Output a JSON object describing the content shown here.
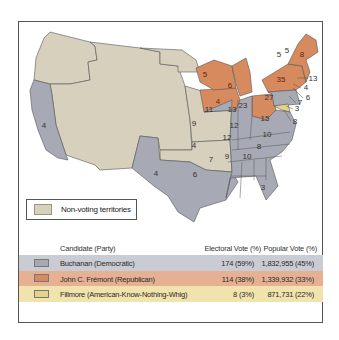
{
  "map": {
    "title": "Election of 1856",
    "colors": {
      "buchanan": "#a7aab4",
      "fremont": "#d68a5e",
      "fillmore": "#e6d38a",
      "territory": "#d6d0bd",
      "water": "#ffffff",
      "border": "#555555"
    },
    "state_labels": [
      {
        "state": "California",
        "value": "4",
        "party": "buchanan"
      },
      {
        "state": "Texas",
        "value": "4",
        "party": "buchanan"
      },
      {
        "state": "Iowa",
        "value": "4",
        "party": "fremont"
      },
      {
        "state": "Wisconsin",
        "value": "5",
        "party": "fremont"
      },
      {
        "state": "Michigan",
        "value": "6",
        "party": "fremont"
      },
      {
        "state": "Ohio",
        "value": "23",
        "party": "fremont"
      },
      {
        "state": "New York",
        "value": "35",
        "party": "fremont"
      },
      {
        "state": "Vermont",
        "value": "5",
        "party": "fremont"
      },
      {
        "state": "New Hampshire",
        "value": "5",
        "party": "fremont"
      },
      {
        "state": "Maine",
        "value": "8",
        "party": "fremont"
      },
      {
        "state": "Massachusetts",
        "value": "13",
        "party": "fremont"
      },
      {
        "state": "Rhode Island",
        "value": "4",
        "party": "fremont"
      },
      {
        "state": "Connecticut",
        "value": "6",
        "party": "fremont"
      },
      {
        "state": "New Jersey",
        "value": "7",
        "party": "buchanan"
      },
      {
        "state": "Delaware",
        "value": "3",
        "party": "buchanan"
      },
      {
        "state": "Maryland",
        "value": "8",
        "party": "fillmore"
      },
      {
        "state": "Pennsylvania",
        "value": "27",
        "party": "buchanan"
      },
      {
        "state": "Illinois",
        "value": "11",
        "party": "buchanan"
      },
      {
        "state": "Indiana",
        "value": "13",
        "party": "buchanan"
      },
      {
        "state": "Missouri",
        "value": "9",
        "party": "buchanan"
      },
      {
        "state": "Kentucky",
        "value": "12",
        "party": "buchanan"
      },
      {
        "state": "Virginia",
        "value": "15",
        "party": "buchanan"
      },
      {
        "state": "Tennessee",
        "value": "12",
        "party": "buchanan"
      },
      {
        "state": "North Carolina",
        "value": "10",
        "party": "buchanan"
      },
      {
        "state": "Arkansas",
        "value": "4",
        "party": "buchanan"
      },
      {
        "state": "South Carolina",
        "value": "8",
        "party": "buchanan"
      },
      {
        "state": "Louisiana",
        "value": "6",
        "party": "buchanan"
      },
      {
        "state": "Mississippi",
        "value": "7",
        "party": "buchanan"
      },
      {
        "state": "Alabama",
        "value": "9",
        "party": "buchanan"
      },
      {
        "state": "Georgia",
        "value": "10",
        "party": "buchanan"
      },
      {
        "state": "Florida",
        "value": "3",
        "party": "buchanan"
      }
    ]
  },
  "legend": {
    "territories_label": "Non-voting territories"
  },
  "table": {
    "headers": {
      "candidate": "Candidate (Party)",
      "electoral": "Electoral Vote (%)",
      "popular": "Popular Vote (%)"
    },
    "rows": [
      {
        "candidate": "Buchanan (Democratic)",
        "electoral": "174 (59%)",
        "popular": "1,832,955 (45%)",
        "color": "#a7aab4",
        "row_bg": "#c9ccd3"
      },
      {
        "candidate": "John C. Frémont (Republican)",
        "electoral": "114 (38%)",
        "popular": "1,339,932 (33%)",
        "color": "#d68a5e",
        "row_bg": "#e6b193"
      },
      {
        "candidate": "Fillmore (American-Know-Nothing-Whig)",
        "electoral": "8 (3%)",
        "popular": "871,731 (22%)",
        "color": "#e6d38a",
        "row_bg": "#f1e3ad"
      }
    ]
  }
}
